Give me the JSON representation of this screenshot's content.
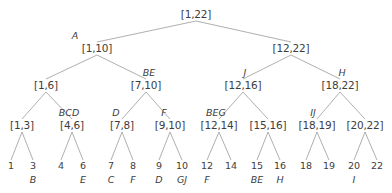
{
  "figure": {
    "kind": "interval-tree-diagram",
    "colors": {
      "text": "#3d3d3d",
      "edge": "#9a9a9a",
      "background": "#ffffff"
    }
  },
  "levels": {
    "root": {
      "label": "[1,22]",
      "x": 196,
      "y": 14
    },
    "level2": [
      {
        "label": "[1,10]",
        "tag": "A",
        "x": 97,
        "y": 48
      },
      {
        "label": "[12,22]",
        "tag": "",
        "x": 291,
        "y": 48
      }
    ],
    "level3": [
      {
        "label": "[1,6]",
        "tag": "",
        "x": 46,
        "y": 85
      },
      {
        "label": "[7,10]",
        "tag": "BE",
        "x": 146,
        "y": 85
      },
      {
        "label": "[12,16]",
        "tag": "J",
        "x": 243,
        "y": 85
      },
      {
        "label": "[18,22]",
        "tag": "H",
        "x": 340,
        "y": 85
      }
    ],
    "level4": [
      {
        "label": "[1,3]",
        "tag": "",
        "x": 22,
        "y": 125
      },
      {
        "label": "[4,6]",
        "tag": "BCD",
        "x": 72,
        "y": 125
      },
      {
        "label": "[7,8]",
        "tag": "D",
        "x": 122,
        "y": 125
      },
      {
        "label": "[9,10]",
        "tag": "F",
        "x": 170,
        "y": 125
      },
      {
        "label": "[12,14]",
        "tag": "BEG",
        "x": 219,
        "y": 125
      },
      {
        "label": "[15,16]",
        "tag": "",
        "x": 268,
        "y": 125
      },
      {
        "label": "[18,19]",
        "tag": "IJ",
        "x": 317,
        "y": 125
      },
      {
        "label": "[20,22]",
        "tag": "",
        "x": 365,
        "y": 125
      }
    ],
    "leaves": [
      {
        "num": "1",
        "tag": "",
        "x": 11,
        "y": 166
      },
      {
        "num": "3",
        "tag": "B",
        "x": 33,
        "y": 166
      },
      {
        "num": "4",
        "tag": "",
        "x": 61,
        "y": 166
      },
      {
        "num": "6",
        "tag": "E",
        "x": 83,
        "y": 166
      },
      {
        "num": "7",
        "tag": "C",
        "x": 111,
        "y": 166
      },
      {
        "num": "8",
        "tag": "F",
        "x": 133,
        "y": 166
      },
      {
        "num": "9",
        "tag": "D",
        "x": 159,
        "y": 166
      },
      {
        "num": "10",
        "tag": "GJ",
        "x": 182,
        "y": 166
      },
      {
        "num": "12",
        "tag": "F",
        "x": 207,
        "y": 166
      },
      {
        "num": "14",
        "tag": "",
        "x": 231,
        "y": 166
      },
      {
        "num": "15",
        "tag": "BE",
        "x": 257,
        "y": 166
      },
      {
        "num": "16",
        "tag": "H",
        "x": 280,
        "y": 166
      },
      {
        "num": "18",
        "tag": "",
        "x": 306,
        "y": 166
      },
      {
        "num": "19",
        "tag": "",
        "x": 329,
        "y": 166
      },
      {
        "num": "20",
        "tag": "I",
        "x": 354,
        "y": 166
      },
      {
        "num": "22",
        "tag": "",
        "x": 377,
        "y": 166
      }
    ]
  },
  "edges": [
    {
      "x1": 196,
      "y1": 21,
      "x2": 97,
      "y2": 42
    },
    {
      "x1": 196,
      "y1": 21,
      "x2": 291,
      "y2": 42
    },
    {
      "x1": 97,
      "y1": 55,
      "x2": 46,
      "y2": 79
    },
    {
      "x1": 97,
      "y1": 55,
      "x2": 146,
      "y2": 79
    },
    {
      "x1": 291,
      "y1": 55,
      "x2": 243,
      "y2": 79
    },
    {
      "x1": 291,
      "y1": 55,
      "x2": 340,
      "y2": 79
    },
    {
      "x1": 46,
      "y1": 92,
      "x2": 22,
      "y2": 119
    },
    {
      "x1": 46,
      "y1": 92,
      "x2": 72,
      "y2": 119
    },
    {
      "x1": 146,
      "y1": 92,
      "x2": 122,
      "y2": 119
    },
    {
      "x1": 146,
      "y1": 92,
      "x2": 170,
      "y2": 119
    },
    {
      "x1": 243,
      "y1": 92,
      "x2": 219,
      "y2": 119
    },
    {
      "x1": 243,
      "y1": 92,
      "x2": 268,
      "y2": 119
    },
    {
      "x1": 340,
      "y1": 92,
      "x2": 317,
      "y2": 119
    },
    {
      "x1": 340,
      "y1": 92,
      "x2": 365,
      "y2": 119
    },
    {
      "x1": 22,
      "y1": 132,
      "x2": 11,
      "y2": 160
    },
    {
      "x1": 22,
      "y1": 132,
      "x2": 33,
      "y2": 160
    },
    {
      "x1": 72,
      "y1": 132,
      "x2": 61,
      "y2": 160
    },
    {
      "x1": 72,
      "y1": 132,
      "x2": 83,
      "y2": 160
    },
    {
      "x1": 122,
      "y1": 132,
      "x2": 111,
      "y2": 160
    },
    {
      "x1": 122,
      "y1": 132,
      "x2": 133,
      "y2": 160
    },
    {
      "x1": 170,
      "y1": 132,
      "x2": 159,
      "y2": 160
    },
    {
      "x1": 170,
      "y1": 132,
      "x2": 182,
      "y2": 160
    },
    {
      "x1": 219,
      "y1": 132,
      "x2": 207,
      "y2": 160
    },
    {
      "x1": 219,
      "y1": 132,
      "x2": 231,
      "y2": 160
    },
    {
      "x1": 268,
      "y1": 132,
      "x2": 257,
      "y2": 160
    },
    {
      "x1": 268,
      "y1": 132,
      "x2": 280,
      "y2": 160
    },
    {
      "x1": 317,
      "y1": 132,
      "x2": 306,
      "y2": 160
    },
    {
      "x1": 317,
      "y1": 132,
      "x2": 329,
      "y2": 160
    },
    {
      "x1": 365,
      "y1": 132,
      "x2": 354,
      "y2": 160
    },
    {
      "x1": 365,
      "y1": 132,
      "x2": 377,
      "y2": 160
    }
  ]
}
